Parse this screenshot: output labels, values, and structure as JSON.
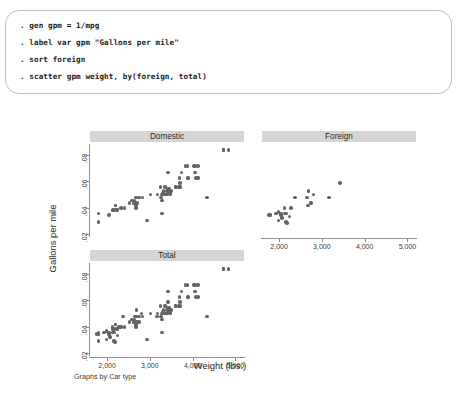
{
  "console": {
    "lines": [
      ". gen gpm = 1/mpg",
      ". label var gpm \"Gallons per mile\"",
      ". sort foreign",
      ". scatter gpm weight, by(foreign, total)"
    ]
  },
  "graph": {
    "note": "Graphs by Car type",
    "xlabel": "Weight (lbs.)",
    "ylabel": "Gallons per mile",
    "marker_color": "#636363",
    "title_bar_color": "#d5d5d5",
    "axis_color": "#8e8e8e"
  },
  "chart_data": {
    "type": "scatter",
    "title": "",
    "xlabel": "Weight (lbs.)",
    "ylabel": "Gallons per mile",
    "xlim": [
      1600,
      5200
    ],
    "ylim": [
      0.018,
      0.088
    ],
    "xticks": [
      2000,
      3000,
      4000,
      5000
    ],
    "xticklabels": [
      "2,000",
      "3,000",
      "4,000",
      "5,000"
    ],
    "yticks": [
      0.02,
      0.04,
      0.06,
      0.08
    ],
    "yticklabels": [
      ".02",
      ".04",
      ".06",
      ".08"
    ],
    "grid": false,
    "legend": "none",
    "panel_layout": "by(foreign, total)",
    "panels": [
      {
        "name": "Domestic",
        "points": [
          [
            2930,
            0.0303
          ],
          [
            3350,
            0.0556
          ],
          [
            2640,
            0.0455
          ],
          [
            3250,
            0.0556
          ],
          [
            4080,
            0.0625
          ],
          [
            3670,
            0.0556
          ],
          [
            2230,
            0.0385
          ],
          [
            3280,
            0.05
          ],
          [
            3880,
            0.0625
          ],
          [
            3400,
            0.0526
          ],
          [
            3900,
            0.0625
          ],
          [
            4330,
            0.0476
          ],
          [
            3720,
            0.0556
          ],
          [
            3370,
            0.05
          ],
          [
            4130,
            0.0625
          ],
          [
            4720,
            0.0833
          ],
          [
            3310,
            0.05
          ],
          [
            3370,
            0.05
          ],
          [
            2830,
            0.0476
          ],
          [
            3370,
            0.05
          ],
          [
            2200,
            0.0417
          ],
          [
            2520,
            0.0435
          ],
          [
            2330,
            0.04
          ],
          [
            2200,
            0.0417
          ],
          [
            2670,
            0.0417
          ],
          [
            2640,
            0.0435
          ],
          [
            2130,
            0.0385
          ],
          [
            2670,
            0.0476
          ],
          [
            2160,
            0.0385
          ],
          [
            4060,
            0.0667
          ],
          [
            3600,
            0.0556
          ],
          [
            3600,
            0.0556
          ],
          [
            3740,
            0.0667
          ],
          [
            4840,
            0.0833
          ],
          [
            4720,
            0.0833
          ],
          [
            3430,
            0.0667
          ],
          [
            3260,
            0.0476
          ],
          [
            2700,
            0.0435
          ],
          [
            3690,
            0.0556
          ],
          [
            3180,
            0.05
          ],
          [
            3280,
            0.0357
          ],
          [
            1800,
            0.0357
          ],
          [
            1800,
            0.0294
          ],
          [
            2050,
            0.0345
          ],
          [
            2410,
            0.04
          ],
          [
            2670,
            0.04
          ],
          [
            2230,
            0.0385
          ],
          [
            3280,
            0.0455
          ],
          [
            3880,
            0.0714
          ],
          [
            4030,
            0.0714
          ],
          [
            4060,
            0.0714
          ],
          [
            3830,
            0.0714
          ],
          [
            4130,
            0.0714
          ],
          [
            2750,
            0.0476
          ],
          [
            3015,
            0.05
          ],
          [
            3420,
            0.0526
          ],
          [
            3425,
            0.0541
          ],
          [
            3435,
            0.0513
          ],
          [
            3445,
            0.0526
          ],
          [
            3460,
            0.0541
          ],
          [
            3465,
            0.0513
          ],
          [
            3470,
            0.05
          ],
          [
            3500,
            0.0526
          ],
          [
            2620,
            0.0435
          ],
          [
            2580,
            0.0455
          ],
          [
            3690,
            0.0625
          ],
          [
            3700,
            0.0588
          ],
          [
            3360,
            0.05
          ],
          [
            3320,
            0.0526
          ],
          [
            3310,
            0.0513
          ]
        ]
      },
      {
        "name": "Foreign",
        "points": [
          [
            2800,
            0.05
          ],
          [
            2670,
            0.0417
          ],
          [
            2130,
            0.0357
          ],
          [
            2160,
            0.0294
          ],
          [
            2040,
            0.0345
          ],
          [
            1990,
            0.0303
          ],
          [
            2160,
            0.0357
          ],
          [
            2040,
            0.0357
          ],
          [
            1930,
            0.0357
          ],
          [
            1990,
            0.037
          ],
          [
            3170,
            0.0476
          ],
          [
            2690,
            0.0526
          ],
          [
            2370,
            0.0476
          ],
          [
            2280,
            0.04
          ],
          [
            2750,
            0.0435
          ],
          [
            3420,
            0.0588
          ],
          [
            2650,
            0.0476
          ],
          [
            1800,
            0.0345
          ],
          [
            1760,
            0.0345
          ],
          [
            2070,
            0.0323
          ],
          [
            2130,
            0.04
          ],
          [
            2190,
            0.0286
          ],
          [
            2240,
            0.0333
          ]
        ]
      },
      {
        "name": "Total",
        "points": [
          [
            2930,
            0.0303
          ],
          [
            3350,
            0.0556
          ],
          [
            2640,
            0.0455
          ],
          [
            3250,
            0.0556
          ],
          [
            4080,
            0.0625
          ],
          [
            3670,
            0.0556
          ],
          [
            2230,
            0.0385
          ],
          [
            3280,
            0.05
          ],
          [
            3880,
            0.0625
          ],
          [
            3400,
            0.0526
          ],
          [
            3900,
            0.0625
          ],
          [
            4330,
            0.0476
          ],
          [
            3720,
            0.0556
          ],
          [
            3370,
            0.05
          ],
          [
            4130,
            0.0625
          ],
          [
            4720,
            0.0833
          ],
          [
            3310,
            0.05
          ],
          [
            3370,
            0.05
          ],
          [
            2830,
            0.0476
          ],
          [
            3370,
            0.05
          ],
          [
            2200,
            0.0417
          ],
          [
            2520,
            0.0435
          ],
          [
            2330,
            0.04
          ],
          [
            2200,
            0.0417
          ],
          [
            2670,
            0.0417
          ],
          [
            2640,
            0.0435
          ],
          [
            2130,
            0.0385
          ],
          [
            2670,
            0.0476
          ],
          [
            2160,
            0.0385
          ],
          [
            4060,
            0.0667
          ],
          [
            3600,
            0.0556
          ],
          [
            3600,
            0.0556
          ],
          [
            3740,
            0.0667
          ],
          [
            4840,
            0.0833
          ],
          [
            4720,
            0.0833
          ],
          [
            3430,
            0.0667
          ],
          [
            3260,
            0.0476
          ],
          [
            2700,
            0.0435
          ],
          [
            3690,
            0.0556
          ],
          [
            3180,
            0.05
          ],
          [
            3280,
            0.0357
          ],
          [
            1800,
            0.0357
          ],
          [
            1800,
            0.0294
          ],
          [
            2050,
            0.0345
          ],
          [
            2410,
            0.04
          ],
          [
            2670,
            0.04
          ],
          [
            2230,
            0.0385
          ],
          [
            3280,
            0.0455
          ],
          [
            3880,
            0.0714
          ],
          [
            4030,
            0.0714
          ],
          [
            4060,
            0.0714
          ],
          [
            3830,
            0.0714
          ],
          [
            4130,
            0.0714
          ],
          [
            2750,
            0.0476
          ],
          [
            3015,
            0.05
          ],
          [
            3420,
            0.0526
          ],
          [
            3425,
            0.0541
          ],
          [
            3435,
            0.0513
          ],
          [
            3445,
            0.0526
          ],
          [
            3460,
            0.0541
          ],
          [
            3465,
            0.0513
          ],
          [
            3470,
            0.05
          ],
          [
            3500,
            0.0526
          ],
          [
            2620,
            0.0435
          ],
          [
            2580,
            0.0455
          ],
          [
            3690,
            0.0625
          ],
          [
            3700,
            0.0588
          ],
          [
            3360,
            0.05
          ],
          [
            3320,
            0.0526
          ],
          [
            3310,
            0.0513
          ],
          [
            2800,
            0.05
          ],
          [
            2670,
            0.0417
          ],
          [
            2130,
            0.0357
          ],
          [
            2160,
            0.0294
          ],
          [
            2040,
            0.0345
          ],
          [
            1990,
            0.0303
          ],
          [
            2160,
            0.0357
          ],
          [
            2040,
            0.0357
          ],
          [
            1930,
            0.0357
          ],
          [
            1990,
            0.037
          ],
          [
            3170,
            0.0476
          ],
          [
            2690,
            0.0526
          ],
          [
            2370,
            0.0476
          ],
          [
            2280,
            0.04
          ],
          [
            2750,
            0.0435
          ],
          [
            3420,
            0.0588
          ],
          [
            2650,
            0.0476
          ],
          [
            1800,
            0.0345
          ],
          [
            1760,
            0.0345
          ],
          [
            2070,
            0.0323
          ],
          [
            2130,
            0.04
          ],
          [
            2190,
            0.0286
          ],
          [
            2240,
            0.0333
          ]
        ]
      }
    ]
  }
}
